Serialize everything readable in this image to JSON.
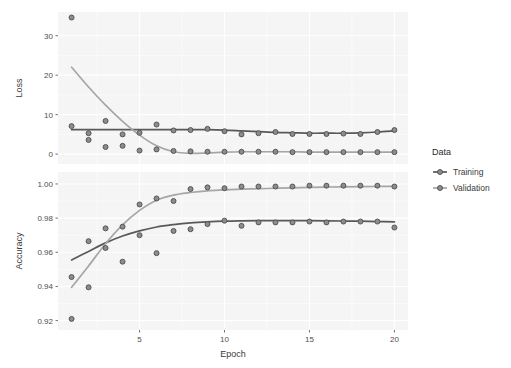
{
  "chart_data": {
    "type": "scatter",
    "title": "",
    "xlabel": "Epoch",
    "facets": [
      {
        "name": "Loss",
        "ylabel": "Loss",
        "yticks": [
          0,
          10,
          20,
          30
        ],
        "yticklabels": [
          "0",
          "10",
          "20",
          "30"
        ],
        "ylim": [
          -2.5,
          36
        ],
        "series": [
          {
            "name": "Training",
            "x": [
              1,
              2,
              3,
              4,
              5,
              6,
              7,
              8,
              9,
              10,
              11,
              12,
              13,
              14,
              15,
              16,
              17,
              18,
              19,
              20
            ],
            "values": [
              7.1,
              5.3,
              8.4,
              5.0,
              5.4,
              7.5,
              6.0,
              6.1,
              6.4,
              5.8,
              5.0,
              5.3,
              5.6,
              5.1,
              5.1,
              5.1,
              5.2,
              5.1,
              5.6,
              6.1
            ]
          },
          {
            "name": "Validation",
            "x": [
              1,
              2,
              3,
              4,
              5,
              6,
              7,
              8,
              9,
              10,
              11,
              12,
              13,
              14,
              15,
              16,
              17,
              18,
              19,
              20
            ],
            "values": [
              34.6,
              3.6,
              1.8,
              2.1,
              0.9,
              1.2,
              0.8,
              0.7,
              0.6,
              0.6,
              0.6,
              0.6,
              0.6,
              0.5,
              0.5,
              0.5,
              0.5,
              0.5,
              0.5,
              0.5
            ]
          }
        ],
        "smooth": [
          {
            "name": "Training",
            "x": [
              1,
              2,
              3,
              4,
              5,
              6,
              7,
              8,
              9,
              10,
              11,
              12,
              13,
              14,
              15,
              16,
              17,
              18,
              19,
              20
            ],
            "values": [
              6.2,
              6.2,
              6.2,
              6.2,
              6.2,
              6.2,
              6.2,
              6.2,
              6.2,
              6.1,
              5.9,
              5.7,
              5.5,
              5.4,
              5.3,
              5.3,
              5.3,
              5.4,
              5.6,
              5.9
            ]
          },
          {
            "name": "Validation",
            "x": [
              1,
              2,
              3,
              4,
              5,
              6,
              7,
              8,
              9,
              10,
              11,
              12,
              13,
              14,
              15,
              16,
              17,
              18,
              19,
              20
            ],
            "values": [
              22.0,
              17.0,
              12.4,
              8.3,
              4.8,
              2.1,
              0.6,
              0.2,
              0.3,
              0.5,
              0.6,
              0.6,
              0.6,
              0.6,
              0.5,
              0.5,
              0.5,
              0.5,
              0.5,
              0.5
            ]
          }
        ]
      },
      {
        "name": "Accuracy",
        "ylabel": "Accuracy",
        "yticks": [
          0.92,
          0.94,
          0.96,
          0.98,
          1.0
        ],
        "yticklabels": [
          "0.92",
          "0.94",
          "0.96",
          "0.98",
          "1.00"
        ],
        "ylim": [
          0.9145,
          1.007
        ],
        "series": [
          {
            "name": "Training",
            "x": [
              1,
              2,
              3,
              4,
              5,
              6,
              7,
              8,
              9,
              10,
              11,
              12,
              13,
              14,
              15,
              16,
              17,
              18,
              19,
              20
            ],
            "values": [
              0.9455,
              0.9665,
              0.9625,
              0.9545,
              0.97,
              0.9595,
              0.9725,
              0.9735,
              0.9765,
              0.9785,
              0.9755,
              0.9775,
              0.9775,
              0.9775,
              0.978,
              0.9775,
              0.978,
              0.978,
              0.978,
              0.9745
            ]
          },
          {
            "name": "Validation",
            "x": [
              1,
              2,
              3,
              4,
              5,
              6,
              7,
              8,
              9,
              10,
              11,
              12,
              13,
              14,
              15,
              16,
              17,
              18,
              19,
              20
            ],
            "values": [
              0.921,
              0.9395,
              0.974,
              0.975,
              0.988,
              0.9915,
              0.99,
              0.997,
              0.998,
              0.9975,
              0.9985,
              0.9985,
              0.9985,
              0.9985,
              0.999,
              0.999,
              0.999,
              0.999,
              0.999,
              0.9985
            ]
          }
        ],
        "smooth": [
          {
            "name": "Training",
            "x": [
              1,
              2,
              3,
              4,
              5,
              6,
              7,
              8,
              9,
              10,
              11,
              12,
              13,
              14,
              15,
              16,
              17,
              18,
              19,
              20
            ],
            "values": [
              0.9555,
              0.9605,
              0.9655,
              0.9695,
              0.9725,
              0.9748,
              0.9762,
              0.9772,
              0.9778,
              0.9782,
              0.9784,
              0.9785,
              0.9785,
              0.9785,
              0.9785,
              0.9784,
              0.9783,
              0.9782,
              0.978,
              0.9778
            ]
          },
          {
            "name": "Validation",
            "x": [
              1,
              2,
              3,
              4,
              5,
              6,
              7,
              8,
              9,
              10,
              11,
              12,
              13,
              14,
              15,
              16,
              17,
              18,
              19,
              20
            ],
            "values": [
              0.9395,
              0.952,
              0.965,
              0.976,
              0.9845,
              0.9905,
              0.9935,
              0.995,
              0.996,
              0.9965,
              0.997,
              0.9972,
              0.9975,
              0.9977,
              0.998,
              0.9982,
              0.9983,
              0.9984,
              0.9985,
              0.9986
            ]
          }
        ]
      }
    ],
    "xticks": [
      5,
      10,
      15,
      20
    ],
    "xticklabels": [
      "5",
      "10",
      "15",
      "20"
    ],
    "xlim": [
      0.2,
      20.8
    ],
    "grid": true,
    "legend": {
      "title": "Data",
      "position": "right",
      "entries": [
        {
          "label": "Training",
          "color": "#595959"
        },
        {
          "label": "Validation",
          "color": "#a6a6a6"
        }
      ]
    }
  },
  "colors": {
    "panel_background": "#f5f5f5",
    "grid_line": "#ffffff",
    "training": "#595959",
    "validation": "#a6a6a6",
    "point_fill": "#8c8c8c",
    "point_stroke": "#4d4d4d",
    "axis_text": "#4d4d4d",
    "plot_background": "#ffffff"
  }
}
